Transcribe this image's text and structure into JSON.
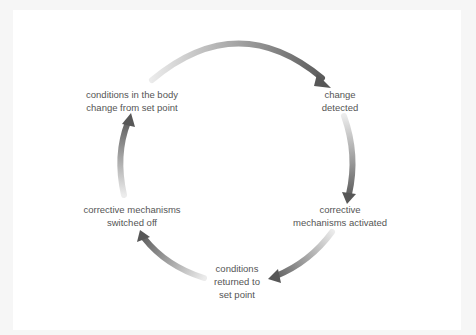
{
  "diagram": {
    "type": "cycle",
    "title": "",
    "direction": "clockwise",
    "arrow_color": "#5a5a5a",
    "arrow_fade_color": "#e6e6e6",
    "text_color": "#555555",
    "nodes": [
      {
        "id": "change-detected",
        "lines": [
          "change",
          "detected"
        ]
      },
      {
        "id": "corrective-mechanisms-activated",
        "lines": [
          "corrective",
          "mechanisms activated"
        ]
      },
      {
        "id": "conditions-returned",
        "lines": [
          "conditions",
          "returned to",
          "set point"
        ]
      },
      {
        "id": "corrective-mechanisms-off",
        "lines": [
          "corrective mechanisms",
          "switched off"
        ]
      },
      {
        "id": "conditions-change",
        "lines": [
          "conditions in the body",
          "change from set point"
        ]
      }
    ],
    "edges": [
      {
        "from": "conditions-change",
        "to": "change-detected"
      },
      {
        "from": "change-detected",
        "to": "corrective-mechanisms-activated"
      },
      {
        "from": "corrective-mechanisms-activated",
        "to": "conditions-returned"
      },
      {
        "from": "conditions-returned",
        "to": "corrective-mechanisms-off"
      },
      {
        "from": "corrective-mechanisms-off",
        "to": "conditions-change"
      }
    ]
  }
}
